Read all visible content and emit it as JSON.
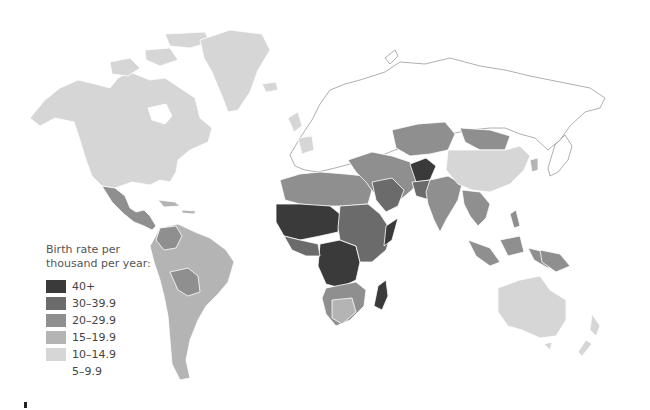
{
  "legend": {
    "title_line1": "Birth rate per",
    "title_line2": "thousand per year:",
    "items": [
      {
        "label": "40+",
        "color": "#3a3a3a"
      },
      {
        "label": "30–39.9",
        "color": "#6b6b6b"
      },
      {
        "label": "20–29.9",
        "color": "#8f8f8f"
      },
      {
        "label": "15–19.9",
        "color": "#b4b4b4"
      },
      {
        "label": "10–14.9",
        "color": "#d6d6d6"
      },
      {
        "label": "5–9.9",
        "color": "#ffffff"
      }
    ]
  },
  "map": {
    "type": "choropleth world map",
    "variable": "Birth rate per thousand per year",
    "regions": [
      {
        "name": "North America (USA, Canada)",
        "class": "10–14.9"
      },
      {
        "name": "Greenland",
        "class": "10–14.9"
      },
      {
        "name": "Mexico & Central America",
        "class": "20–29.9"
      },
      {
        "name": "Caribbean",
        "class": "15–19.9"
      },
      {
        "name": "South America (most)",
        "class": "15–19.9"
      },
      {
        "name": "Bolivia / Paraguay / Colombia",
        "class": "20–29.9"
      },
      {
        "name": "Europe / Russia / Japan",
        "class": "5–9.9"
      },
      {
        "name": "Ireland / France / Iceland",
        "class": "10–14.9"
      },
      {
        "name": "North Africa",
        "class": "20–29.9"
      },
      {
        "name": "Sahel & Central Africa",
        "class": "40+"
      },
      {
        "name": "East Africa",
        "class": "30–39.9"
      },
      {
        "name": "Southern Africa",
        "class": "20–29.9"
      },
      {
        "name": "Madagascar",
        "class": "40+"
      },
      {
        "name": "Middle East",
        "class": "20–29.9"
      },
      {
        "name": "Afghanistan",
        "class": "40+"
      },
      {
        "name": "Pakistan",
        "class": "30–39.9"
      },
      {
        "name": "India / South Asia",
        "class": "20–29.9"
      },
      {
        "name": "Central Asia / Mongolia",
        "class": "20–29.9"
      },
      {
        "name": "China",
        "class": "10–14.9"
      },
      {
        "name": "Southeast Asia / Indonesia",
        "class": "20–29.9"
      },
      {
        "name": "Australia / New Zealand",
        "class": "10–14.9"
      }
    ]
  }
}
